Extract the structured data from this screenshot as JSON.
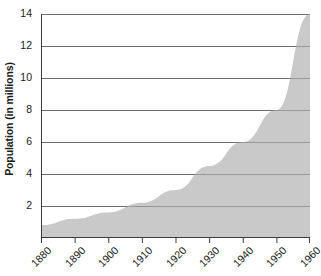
{
  "chart_data": {
    "type": "area",
    "title": "",
    "xlabel": "",
    "ylabel": "Population (in millions)",
    "x": [
      1880,
      1890,
      1900,
      1910,
      1920,
      1930,
      1940,
      1950,
      1960
    ],
    "values": [
      0.8,
      1.2,
      1.6,
      2.2,
      3.0,
      4.5,
      6.0,
      8.0,
      14.0
    ],
    "series": [
      {
        "name": "Population",
        "values": [
          0.8,
          1.2,
          1.6,
          2.2,
          3.0,
          4.5,
          6.0,
          8.0,
          14.0
        ]
      }
    ],
    "categories": [
      "1880",
      "1890",
      "1900",
      "1910",
      "1920",
      "1930",
      "1940",
      "1950",
      "1960"
    ],
    "xlim": [
      1880,
      1960
    ],
    "ylim": [
      0,
      14
    ],
    "y_ticks": [
      2,
      4,
      6,
      8,
      10,
      12,
      14
    ],
    "y_tick_labels": [
      "2",
      "4",
      "6",
      "8",
      "10",
      "12",
      "14"
    ],
    "x_ticks": [
      1880,
      1890,
      1900,
      1910,
      1920,
      1930,
      1940,
      1950,
      1960
    ],
    "x_tick_labels": [
      "1880",
      "1890",
      "1900",
      "1910",
      "1920",
      "1930",
      "1940",
      "1950",
      "1960"
    ],
    "grid": true,
    "grid_axis": "y",
    "legend": false,
    "legend_position": "none",
    "x_tick_label_rotation": -45,
    "colors": {
      "area_fill": "#c9c9c9",
      "grid_line": "#6e6e6e",
      "axis_line": "#3c3c3c",
      "text": "#1a1a1a",
      "background": "#ffffff"
    }
  },
  "axes": {
    "y_title": "Population (in millions)"
  }
}
